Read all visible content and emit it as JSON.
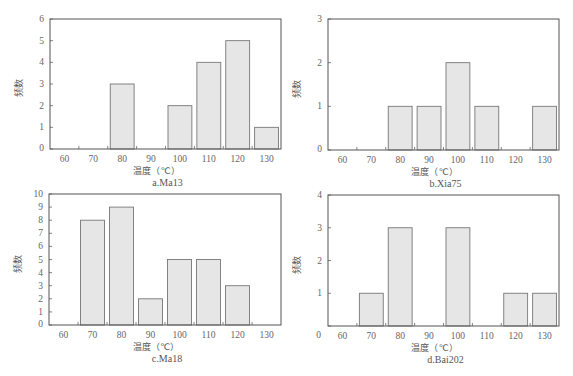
{
  "chart_data": [
    {
      "type": "bar",
      "title": "a.Ma13",
      "xlabel": "温度（℃）",
      "ylabel": "频数",
      "categories": [
        "60",
        "70",
        "80",
        "90",
        "100",
        "110",
        "120",
        "130"
      ],
      "values": [
        0,
        0,
        3,
        0,
        2,
        4,
        5,
        1
      ],
      "ylim": [
        0,
        6
      ],
      "yticks": [
        0,
        1,
        2,
        3,
        4,
        5,
        6
      ],
      "grid": false,
      "box": {
        "x0": 50,
        "y0": 19,
        "x1": 281,
        "y1": 149
      }
    },
    {
      "type": "bar",
      "title": "b.Xia75",
      "xlabel": "温度（℃）",
      "ylabel": "频数",
      "categories": [
        "60",
        "70",
        "80",
        "90",
        "100",
        "110",
        "120",
        "130"
      ],
      "values": [
        0,
        0,
        1,
        1,
        2,
        1,
        0,
        1
      ],
      "ylim": [
        0,
        3
      ],
      "yticks": [
        0,
        1,
        2,
        3
      ],
      "grid": false,
      "box": {
        "x0": 328,
        "y0": 19,
        "x1": 559,
        "y1": 150
      }
    },
    {
      "type": "bar",
      "title": "c.Ma18",
      "xlabel": "温度（℃）",
      "ylabel": "频数",
      "categories": [
        "60",
        "70",
        "80",
        "90",
        "100",
        "110",
        "120",
        "130"
      ],
      "values": [
        0,
        8,
        9,
        2,
        5,
        5,
        3,
        0
      ],
      "ylim": [
        0,
        10
      ],
      "yticks": [
        0,
        1,
        2,
        3,
        4,
        5,
        6,
        7,
        8,
        9,
        10
      ],
      "grid": false,
      "box": {
        "x0": 49,
        "y0": 194,
        "x1": 281,
        "y1": 325
      }
    },
    {
      "type": "bar",
      "title": "d.Bai202",
      "xlabel": "温度（℃）",
      "ylabel": "频数",
      "categories": [
        "60",
        "70",
        "80",
        "90",
        "100",
        "110",
        "120",
        "130"
      ],
      "values": [
        0,
        1,
        3,
        0,
        3,
        0,
        1,
        1
      ],
      "ylim": [
        0,
        4
      ],
      "yticks": [
        0,
        1,
        2,
        3,
        4
      ],
      "zero_label_offset": true,
      "grid": false,
      "box": {
        "x0": 328,
        "y0": 195,
        "x1": 559,
        "y1": 326
      }
    }
  ]
}
